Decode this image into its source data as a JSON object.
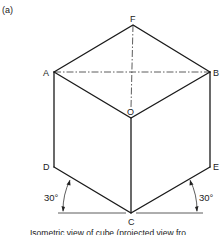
{
  "figure": {
    "label": "(a)",
    "caption": "Isometric view of cube (projected view fro",
    "vertices": {
      "F": "F",
      "A": "A",
      "B": "B",
      "O": "O",
      "D": "D",
      "E": "E",
      "C": "C"
    },
    "angles": {
      "left": "30°",
      "right": "30°"
    }
  }
}
